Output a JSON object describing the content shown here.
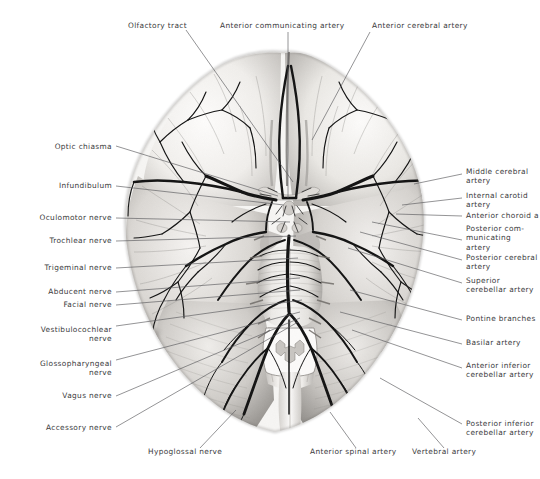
{
  "figure": {
    "kind": "anatomical-illustration",
    "style": "grayscale halftone photograph with thin black leader lines",
    "background_color": "#ffffff",
    "label_color": "#3a3a3c",
    "leader_color": "#5a5a5c",
    "vessel_color": "#151515",
    "tissue_light": "#f2f1ef",
    "tissue_mid": "#cfcdca",
    "tissue_dark": "#8e8c89"
  },
  "labels": [
    {
      "id": "olfactory-tract",
      "text": "Olfactory tract",
      "side": "top-left",
      "x": 128,
      "y": 26,
      "align": "left",
      "lines": [
        "Olfactory tract"
      ]
    },
    {
      "id": "anterior-communicating-artery",
      "text": "Anterior communicating artery",
      "side": "top",
      "x": 220,
      "y": 26,
      "align": "left",
      "lines": [
        "Anterior communicating artery"
      ]
    },
    {
      "id": "anterior-cerebral-artery",
      "text": "Anterior cerebral artery",
      "side": "top-right",
      "x": 372,
      "y": 26,
      "align": "left",
      "lines": [
        "Anterior cerebral artery"
      ]
    },
    {
      "id": "optic-chiasma",
      "text": "Optic chiasma",
      "side": "left",
      "x": 112,
      "y": 147,
      "align": "right",
      "lines": [
        "Optic chiasma"
      ]
    },
    {
      "id": "infundibulum",
      "text": "Infundibulum",
      "side": "left",
      "x": 112,
      "y": 186,
      "align": "right",
      "lines": [
        "Infundibulum"
      ]
    },
    {
      "id": "oculomotor-nerve",
      "text": "Oculomotor nerve",
      "side": "left",
      "x": 112,
      "y": 218,
      "align": "right",
      "lines": [
        "Oculomotor nerve"
      ]
    },
    {
      "id": "trochlear-nerve",
      "text": "Trochlear nerve",
      "side": "left",
      "x": 112,
      "y": 241,
      "align": "right",
      "lines": [
        "Trochlear nerve"
      ]
    },
    {
      "id": "trigeminal-nerve",
      "text": "Trigeminal nerve",
      "side": "left",
      "x": 112,
      "y": 268,
      "align": "right",
      "lines": [
        "Trigeminal nerve"
      ]
    },
    {
      "id": "abducent-nerve",
      "text": "Abducent nerve",
      "side": "left",
      "x": 112,
      "y": 292,
      "align": "right",
      "lines": [
        "Abducent nerve"
      ]
    },
    {
      "id": "facial-nerve",
      "text": "Facial nerve",
      "side": "left",
      "x": 112,
      "y": 305,
      "align": "right",
      "lines": [
        "Facial nerve"
      ]
    },
    {
      "id": "vestibulocochlear-nerve",
      "text": "Vestibulocochlear nerve",
      "side": "left",
      "x": 112,
      "y": 330,
      "align": "right",
      "lines": [
        "Vestibulocochlear",
        "nerve"
      ]
    },
    {
      "id": "glossopharyngeal-nerve",
      "text": "Glossopharyngeal nerve",
      "side": "left",
      "x": 112,
      "y": 364,
      "align": "right",
      "lines": [
        "Glossopharyngeal",
        "nerve"
      ]
    },
    {
      "id": "vagus-nerve",
      "text": "Vagus nerve",
      "side": "left",
      "x": 112,
      "y": 396,
      "align": "right",
      "lines": [
        "Vagus nerve"
      ]
    },
    {
      "id": "accessory-nerve",
      "text": "Accessory nerve",
      "side": "left",
      "x": 112,
      "y": 428,
      "align": "right",
      "lines": [
        "Accessory nerve"
      ]
    },
    {
      "id": "middle-cerebral-artery",
      "text": "Middle cerebral artery",
      "side": "right",
      "x": 466,
      "y": 172,
      "align": "left",
      "lines": [
        "Middle cerebral",
        "artery"
      ]
    },
    {
      "id": "internal-carotid-artery",
      "text": "Internal carotid artery",
      "side": "right",
      "x": 466,
      "y": 196,
      "align": "left",
      "lines": [
        "Internal carotid",
        "artery"
      ]
    },
    {
      "id": "anterior-choroid-artery",
      "text": "Anterior choroid a",
      "side": "right",
      "x": 466,
      "y": 216,
      "align": "left",
      "lines": [
        "Anterior choroid a"
      ]
    },
    {
      "id": "posterior-communicating-artery",
      "text": "Posterior communicating artery",
      "side": "right",
      "x": 466,
      "y": 229,
      "align": "left",
      "lines": [
        "Posterior com-",
        "municating",
        "artery"
      ]
    },
    {
      "id": "posterior-cerebral-artery",
      "text": "Posterior cerebral artery",
      "side": "right",
      "x": 466,
      "y": 258,
      "align": "left",
      "lines": [
        "Posterior cerebral",
        "artery"
      ]
    },
    {
      "id": "superior-cerebellar-artery",
      "text": "Superior cerebellar artery",
      "side": "right",
      "x": 466,
      "y": 281,
      "align": "left",
      "lines": [
        "Superior",
        "cerebellar artery"
      ]
    },
    {
      "id": "pontine-branches",
      "text": "Pontine branches",
      "side": "right",
      "x": 466,
      "y": 319,
      "align": "left",
      "lines": [
        "Pontine branches"
      ]
    },
    {
      "id": "basilar-artery",
      "text": "Basilar artery",
      "side": "right",
      "x": 466,
      "y": 343,
      "align": "left",
      "lines": [
        "Basilar artery"
      ]
    },
    {
      "id": "anterior-inferior-cerebellar-artery",
      "text": "Anterior inferior cerebellar artery",
      "side": "right",
      "x": 466,
      "y": 366,
      "align": "left",
      "lines": [
        "Anterior inferior",
        "cerebellar artery"
      ]
    },
    {
      "id": "posterior-inferior-cerebellar-artery",
      "text": "Posterior inferior cerebellar artery",
      "side": "right",
      "x": 466,
      "y": 424,
      "align": "left",
      "lines": [
        "Posterior inferior",
        "cerebellar artery"
      ]
    },
    {
      "id": "hypoglossal-nerve",
      "text": "Hypoglossal nerve",
      "side": "bottom",
      "x": 148,
      "y": 452,
      "align": "left",
      "lines": [
        "Hypoglossal nerve"
      ]
    },
    {
      "id": "anterior-spinal-artery",
      "text": "Anterior spinal artery",
      "side": "bottom",
      "x": 310,
      "y": 452,
      "align": "left",
      "lines": [
        "Anterior spinal artery"
      ]
    },
    {
      "id": "vertebral-artery",
      "text": "Vertebral artery",
      "side": "bottom",
      "x": 412,
      "y": 452,
      "align": "left",
      "lines": [
        "Vertebral artery"
      ]
    }
  ],
  "leader_lines": [
    {
      "id": "leader-olfactory-tract",
      "from": [
        186,
        30
      ],
      "to": [
        293,
        182
      ]
    },
    {
      "id": "leader-anterior-communicating-artery",
      "from": [
        288,
        32
      ],
      "to": [
        288,
        198
      ]
    },
    {
      "id": "leader-anterior-cerebral-artery",
      "from": [
        370,
        32
      ],
      "to": [
        312,
        140
      ]
    },
    {
      "id": "leader-optic-chiasma",
      "from": [
        116,
        146
      ],
      "to": [
        278,
        196
      ]
    },
    {
      "id": "leader-infundibulum",
      "from": [
        116,
        186
      ],
      "to": [
        284,
        205
      ]
    },
    {
      "id": "leader-oculomotor-nerve",
      "from": [
        116,
        218
      ],
      "to": [
        290,
        222
      ]
    },
    {
      "id": "leader-trochlear-nerve",
      "from": [
        116,
        241
      ],
      "to": [
        296,
        236
      ]
    },
    {
      "id": "leader-trigeminal-nerve",
      "from": [
        116,
        268
      ],
      "to": [
        298,
        258
      ]
    },
    {
      "id": "leader-abducent-nerve",
      "from": [
        116,
        292
      ],
      "to": [
        300,
        278
      ]
    },
    {
      "id": "leader-facial-nerve",
      "from": [
        116,
        305
      ],
      "to": [
        300,
        290
      ]
    },
    {
      "id": "leader-vestibulocochlear-nerve",
      "from": [
        116,
        326
      ],
      "to": [
        302,
        300
      ]
    },
    {
      "id": "leader-glossopharyngeal-nerve",
      "from": [
        116,
        360
      ],
      "to": [
        300,
        312
      ]
    },
    {
      "id": "leader-vagus-nerve",
      "from": [
        116,
        396
      ],
      "to": [
        300,
        318
      ]
    },
    {
      "id": "leader-accessory-nerve",
      "from": [
        116,
        427
      ],
      "to": [
        298,
        322
      ]
    },
    {
      "id": "leader-middle-cerebral-artery",
      "from": [
        462,
        174
      ],
      "to": [
        414,
        184
      ]
    },
    {
      "id": "leader-internal-carotid-artery",
      "from": [
        462,
        198
      ],
      "to": [
        402,
        205
      ]
    },
    {
      "id": "leader-anterior-choroid-artery",
      "from": [
        462,
        216
      ],
      "to": [
        396,
        214
      ]
    },
    {
      "id": "leader-posterior-communicating-artery",
      "from": [
        462,
        240
      ],
      "to": [
        372,
        222
      ]
    },
    {
      "id": "leader-posterior-cerebral-artery",
      "from": [
        462,
        260
      ],
      "to": [
        360,
        232
      ]
    },
    {
      "id": "leader-superior-cerebellar-artery",
      "from": [
        462,
        283
      ],
      "to": [
        348,
        248
      ]
    },
    {
      "id": "leader-pontine-branches",
      "from": [
        462,
        320
      ],
      "to": [
        350,
        290
      ]
    },
    {
      "id": "leader-basilar-artery",
      "from": [
        462,
        344
      ],
      "to": [
        340,
        312
      ]
    },
    {
      "id": "leader-anterior-inferior-cerebellar-artery",
      "from": [
        462,
        368
      ],
      "to": [
        352,
        330
      ]
    },
    {
      "id": "leader-posterior-inferior-cerebellar-artery",
      "from": [
        462,
        424
      ],
      "to": [
        380,
        378
      ]
    },
    {
      "id": "leader-hypoglossal-nerve",
      "from": [
        200,
        448
      ],
      "to": [
        236,
        410
      ]
    },
    {
      "id": "leader-anterior-spinal-artery",
      "from": [
        356,
        448
      ],
      "to": [
        330,
        412
      ]
    },
    {
      "id": "leader-vertebral-artery",
      "from": [
        444,
        448
      ],
      "to": [
        418,
        418
      ]
    }
  ]
}
